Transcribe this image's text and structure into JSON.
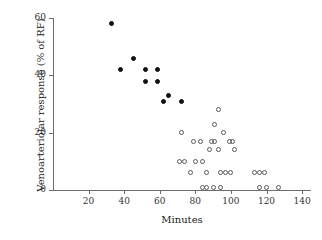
{
  "chart_data": {
    "type": "scatter",
    "title": "",
    "xlabel": "Minutes",
    "ylabel": "Venoarteriolar response (% of RF)",
    "xlim": [
      0,
      145
    ],
    "ylim": [
      0,
      62
    ],
    "xticks": [
      20,
      40,
      60,
      80,
      100,
      120,
      140
    ],
    "yticks": [
      0,
      20,
      40,
      60
    ],
    "grid": false,
    "legend": "none",
    "series": [
      {
        "name": "filled-markers",
        "marker": "filled-circle",
        "color": "#101010",
        "points": [
          {
            "x": 33,
            "y": 58
          },
          {
            "x": 38,
            "y": 42
          },
          {
            "x": 45,
            "y": 46
          },
          {
            "x": 52,
            "y": 42
          },
          {
            "x": 52,
            "y": 38
          },
          {
            "x": 59,
            "y": 42
          },
          {
            "x": 59,
            "y": 38
          },
          {
            "x": 62,
            "y": 31
          },
          {
            "x": 65,
            "y": 33
          },
          {
            "x": 72,
            "y": 31
          }
        ]
      },
      {
        "name": "open-markers",
        "marker": "open-circle",
        "color": "#5a5a5a",
        "points": [
          {
            "x": 72,
            "y": 20
          },
          {
            "x": 71,
            "y": 10
          },
          {
            "x": 74,
            "y": 10
          },
          {
            "x": 77,
            "y": 6
          },
          {
            "x": 79,
            "y": 17
          },
          {
            "x": 80,
            "y": 10
          },
          {
            "x": 83,
            "y": 17
          },
          {
            "x": 84,
            "y": 10
          },
          {
            "x": 86,
            "y": 6
          },
          {
            "x": 84,
            "y": 1
          },
          {
            "x": 86,
            "y": 1
          },
          {
            "x": 88,
            "y": 14
          },
          {
            "x": 89,
            "y": 17
          },
          {
            "x": 91,
            "y": 23
          },
          {
            "x": 91,
            "y": 17
          },
          {
            "x": 90,
            "y": 1
          },
          {
            "x": 93,
            "y": 28
          },
          {
            "x": 93,
            "y": 14
          },
          {
            "x": 94,
            "y": 6
          },
          {
            "x": 94,
            "y": 1
          },
          {
            "x": 96,
            "y": 20
          },
          {
            "x": 97,
            "y": 6
          },
          {
            "x": 99,
            "y": 17
          },
          {
            "x": 100,
            "y": 6
          },
          {
            "x": 101,
            "y": 17
          },
          {
            "x": 102,
            "y": 14
          },
          {
            "x": 113,
            "y": 6
          },
          {
            "x": 116,
            "y": 6
          },
          {
            "x": 119,
            "y": 6
          },
          {
            "x": 116,
            "y": 1
          },
          {
            "x": 120,
            "y": 1
          },
          {
            "x": 127,
            "y": 1
          }
        ]
      }
    ]
  }
}
